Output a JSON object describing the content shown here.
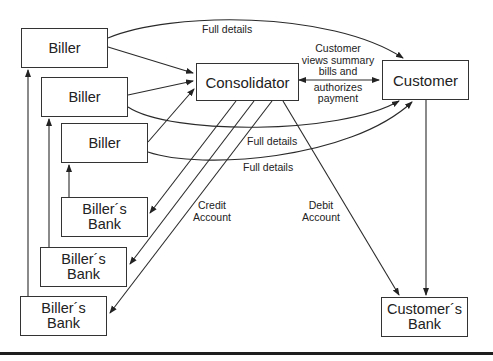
{
  "diagram": {
    "nodes": {
      "biller_1": "Biller",
      "biller_2": "Biller",
      "biller_3": "Biller",
      "consolidator": "Consolidator",
      "customer": "Customer",
      "billers_bank_1": "Biller´s Bank",
      "billers_bank_2": "Biller´s Bank",
      "billers_bank_3": "Biller´s Bank",
      "customers_bank": "Customer´s Bank"
    },
    "labels": {
      "full_details_top": "Full details",
      "full_details_mid": "Full details",
      "full_details_low": "Full details",
      "customer_action": [
        "Customer",
        "views summary",
        "bills and",
        "authorizes",
        "payment"
      ],
      "credit_account": [
        "Credit",
        "Account"
      ],
      "debit_account": [
        "Debit",
        "Account"
      ]
    },
    "edges": [
      {
        "from": "Biller",
        "to": "Consolidator"
      },
      {
        "from": "Biller",
        "to": "Customer",
        "label": "Full details"
      },
      {
        "from": "Consolidator",
        "to": "Customer",
        "label": "Customer views summary bills and authorizes payment",
        "bidirectional": true
      },
      {
        "from": "Consolidator",
        "to": "Biller´s Bank",
        "label": "Credit Account"
      },
      {
        "from": "Consolidator",
        "to": "Customer´s Bank",
        "label": "Debit Account"
      },
      {
        "from": "Customer",
        "to": "Customer´s Bank"
      },
      {
        "from": "Biller´s Bank",
        "to": "Biller"
      }
    ]
  }
}
